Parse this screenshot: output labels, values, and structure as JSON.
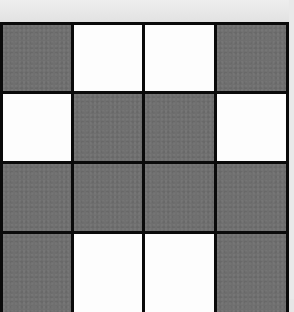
{
  "grid": {
    "rows": 4,
    "cols": 4,
    "colors": {
      "gray": "#6f6f6f",
      "white": "#fdfdfd",
      "border": "#0a0a0a",
      "background": "#e6e6e6"
    },
    "pattern": [
      [
        "gray",
        "white",
        "white",
        "gray"
      ],
      [
        "white",
        "gray",
        "gray",
        "white"
      ],
      [
        "gray",
        "gray",
        "gray",
        "gray"
      ],
      [
        "gray",
        "white",
        "white",
        "gray"
      ]
    ]
  }
}
